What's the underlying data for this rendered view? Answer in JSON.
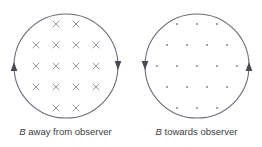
{
  "figure": {
    "background_color": "#ffffff",
    "stroke_color": "#6b6b78",
    "glyph_color": "#8d8d99",
    "text_color": "#3c3c44"
  },
  "panels": [
    {
      "id": "left",
      "field_symbol": "B",
      "caption_text": " away from observer",
      "caption_full": "B away from observer",
      "marker_type": "cross",
      "marker_name": "field-into-page-cross",
      "circulation": "counterclockwise",
      "arrows": [
        {
          "name": "current-arrow-left",
          "side": "left",
          "direction": "up"
        },
        {
          "name": "current-arrow-right",
          "side": "right",
          "direction": "down"
        }
      ],
      "circle": {
        "cx": 66,
        "cy": 66,
        "r": 52
      },
      "marker_rows": [
        {
          "y": 24,
          "xs": [
            56,
            76
          ]
        },
        {
          "y": 45,
          "xs": [
            36,
            56,
            76,
            96
          ]
        },
        {
          "y": 66,
          "xs": [
            36,
            56,
            76,
            96
          ]
        },
        {
          "y": 87,
          "xs": [
            36,
            56,
            76,
            96
          ]
        },
        {
          "y": 108,
          "xs": [
            56,
            76
          ]
        }
      ],
      "marker_count": 16
    },
    {
      "id": "right",
      "field_symbol": "B",
      "caption_text": " towards observer",
      "caption_full": "B towards observer",
      "marker_type": "dot",
      "marker_name": "field-out-of-page-dot",
      "circulation": "clockwise",
      "arrows": [
        {
          "name": "current-arrow-left",
          "side": "left",
          "direction": "down"
        },
        {
          "name": "current-arrow-right",
          "side": "right",
          "direction": "up"
        }
      ],
      "circle": {
        "cx": 66,
        "cy": 66,
        "r": 52
      },
      "marker_rows": [
        {
          "y": 24,
          "xs": [
            46,
            66,
            86
          ]
        },
        {
          "y": 45,
          "xs": [
            36,
            56,
            76,
            96
          ]
        },
        {
          "y": 66,
          "xs": [
            26,
            46,
            66,
            86,
            106
          ]
        },
        {
          "y": 87,
          "xs": [
            36,
            56,
            76,
            96
          ]
        },
        {
          "y": 108,
          "xs": [
            46,
            66,
            86
          ]
        }
      ],
      "marker_count": 19
    }
  ]
}
